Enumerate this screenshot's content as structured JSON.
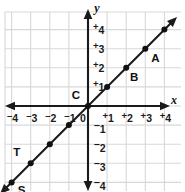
{
  "figure": {
    "background": "#ffffff",
    "grid_color": "#d8d8d8",
    "axis_color": "#1a1a1a",
    "line_color": "#1a1a1a"
  },
  "axes": {
    "x_label": "x",
    "y_label": "y",
    "origin_label": "0",
    "x_ticks": [
      {
        "value": -4,
        "text": "4",
        "sign": "⁻"
      },
      {
        "value": -3,
        "text": "3",
        "sign": "⁻"
      },
      {
        "value": -2,
        "text": "2",
        "sign": "⁻"
      },
      {
        "value": -1,
        "text": "1",
        "sign": "⁻"
      },
      {
        "value": 1,
        "text": "1",
        "sign": "⁺"
      },
      {
        "value": 2,
        "text": "2",
        "sign": "⁺"
      },
      {
        "value": 3,
        "text": "3",
        "sign": "⁺"
      },
      {
        "value": 4,
        "text": "4",
        "sign": "⁺"
      }
    ],
    "y_ticks": [
      {
        "value": 4,
        "text": "4",
        "sign": "⁺"
      },
      {
        "value": 3,
        "text": "3",
        "sign": "⁺"
      },
      {
        "value": 2,
        "text": "2",
        "sign": "⁺"
      },
      {
        "value": 1,
        "text": "1",
        "sign": "⁺"
      },
      {
        "value": -1,
        "text": "1",
        "sign": "−"
      },
      {
        "value": -2,
        "text": "2",
        "sign": "−"
      },
      {
        "value": -3,
        "text": "3",
        "sign": "−"
      },
      {
        "value": -4,
        "text": "4",
        "sign": "−"
      }
    ]
  },
  "chart_data": {
    "type": "scatter",
    "title": "",
    "xlabel": "x",
    "ylabel": "y",
    "xlim": [
      -4.4,
      4.6
    ],
    "ylim": [
      -4.6,
      4.5
    ],
    "grid": true,
    "legend": "none",
    "line": {
      "equation": "y = x",
      "slope": 1,
      "intercept": 0,
      "from": [
        -4.4,
        -4.4
      ],
      "to": [
        4.4,
        4.4
      ],
      "arrows": "both"
    },
    "points": [
      {
        "label": "S",
        "x": -4,
        "y": -4,
        "label_dx": 10,
        "label_dy": 12
      },
      {
        "label": "T",
        "x": -3,
        "y": -3,
        "label_dx": -14,
        "label_dy": -7
      },
      {
        "label": "",
        "x": -2,
        "y": -2,
        "label_dx": 0,
        "label_dy": 0
      },
      {
        "label": "",
        "x": -1,
        "y": -1,
        "label_dx": 0,
        "label_dy": 0
      },
      {
        "label": "C",
        "x": 0,
        "y": 0,
        "label_dx": -12,
        "label_dy": -7
      },
      {
        "label": "",
        "x": 1,
        "y": 1,
        "label_dx": 0,
        "label_dy": 0
      },
      {
        "label": "B",
        "x": 2,
        "y": 2,
        "label_dx": 8,
        "label_dy": 13
      },
      {
        "label": "A",
        "x": 3,
        "y": 3,
        "label_dx": 10,
        "label_dy": 13
      },
      {
        "label": "",
        "x": 4,
        "y": 4,
        "label_dx": 0,
        "label_dy": 0
      }
    ]
  }
}
